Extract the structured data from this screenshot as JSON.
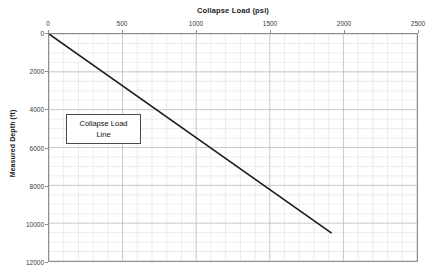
{
  "chart_data": {
    "type": "line",
    "title": "Collapse Load (psi)",
    "xlabel": "Collapse Load (psi)",
    "ylabel": "Measured Depth (ft)",
    "xlim": [
      0,
      2500
    ],
    "ylim": [
      0,
      12000
    ],
    "y_inverted": true,
    "grid": true,
    "legend_position": "none",
    "x_ticks": [
      0,
      500,
      1000,
      1500,
      2000,
      2500
    ],
    "x_tick_labels": [
      "0",
      "500",
      "1000",
      "1500",
      "2000",
      "2500"
    ],
    "y_ticks": [
      0,
      2000,
      4000,
      6000,
      8000,
      10000,
      12000
    ],
    "y_tick_labels": [
      "0",
      "2000",
      "4000",
      "6000",
      "8000",
      "10000",
      "12000"
    ],
    "x_minor_step": 100,
    "y_minor_step": 500,
    "series": [
      {
        "name": "Collapse Load Line",
        "color": "#1a1a1a",
        "x": [
          0,
          1920
        ],
        "y": [
          0,
          10530
        ]
      }
    ],
    "annotations": [
      {
        "text": "Collapse Load\nLine",
        "x": 125,
        "y": 4250
      }
    ]
  },
  "axis": {
    "title": "Collapse Load (psi)",
    "y_title": "Measured Depth (ft)"
  },
  "annotation": {
    "label": "Collapse Load\nLine"
  }
}
